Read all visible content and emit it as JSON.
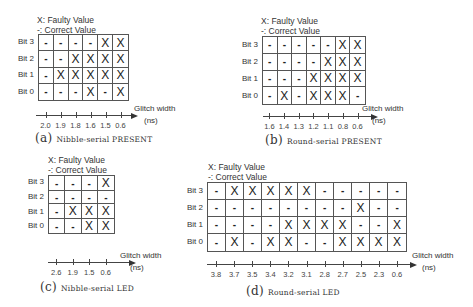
{
  "legend": {
    "faulty": "X: Faulty Value",
    "correct": "-: Correct Value"
  },
  "row_labels": [
    "Bit 3",
    "Bit 2",
    "Bit 1",
    "Bit 0"
  ],
  "axis": {
    "label_line1": "Glitch width",
    "label_line2": "(ns)"
  },
  "panels": [
    {
      "id": "a",
      "tag": "(a)",
      "caption": "Nibble-serial PRESENT",
      "glitch_widths": [
        "2.0",
        "1.9",
        "1.8",
        "1.6",
        "1.5",
        "0.6"
      ],
      "rows": [
        [
          "-",
          "-",
          "-",
          "-",
          "X",
          "X"
        ],
        [
          "-",
          "-",
          "X",
          "X",
          "X",
          "X"
        ],
        [
          "-",
          "X",
          "X",
          "X",
          "X",
          "X"
        ],
        [
          "-",
          "-",
          "-",
          "X",
          "-",
          "X"
        ]
      ]
    },
    {
      "id": "b",
      "tag": "(b)",
      "caption": "Round-serial PRESENT",
      "glitch_widths": [
        "1.6",
        "1.4",
        "1.3",
        "1.2",
        "1.1",
        "0.8",
        "0.6"
      ],
      "rows": [
        [
          "-",
          "-",
          "-",
          "-",
          "-",
          "X",
          "X"
        ],
        [
          "-",
          "-",
          "-",
          "-",
          "X",
          "X",
          "X"
        ],
        [
          "-",
          "-",
          "-",
          "X",
          "X",
          "X",
          "X"
        ],
        [
          "-",
          "X",
          "-",
          "X",
          "X",
          "X",
          "-"
        ]
      ]
    },
    {
      "id": "c",
      "tag": "(c)",
      "caption": "Nibble-serial LED",
      "glitch_widths": [
        "2.6",
        "1.9",
        "1.5",
        "0.6"
      ],
      "rows": [
        [
          "-",
          "-",
          "-",
          "X"
        ],
        [
          "-",
          "-",
          "-",
          "-"
        ],
        [
          "-",
          "X",
          "X",
          "X"
        ],
        [
          "-",
          "-",
          "X",
          "X"
        ]
      ]
    },
    {
      "id": "d",
      "tag": "(d)",
      "caption": "Round-serial LED",
      "glitch_widths": [
        "3.8",
        "3.7",
        "3.5",
        "3.4",
        "3.2",
        "3.1",
        "2.8",
        "2.7",
        "2.5",
        "2.3",
        "0.6"
      ],
      "rows": [
        [
          "-",
          "X",
          "X",
          "X",
          "X",
          "X",
          "-",
          "-",
          "-",
          "-",
          "-"
        ],
        [
          "-",
          "-",
          "-",
          "-",
          "-",
          "-",
          "-",
          "-",
          "X",
          "-",
          "-"
        ],
        [
          "-",
          "-",
          "-",
          "-",
          "X",
          "X",
          "X",
          "X",
          "-",
          "-",
          "X"
        ],
        [
          "-",
          "X",
          "-",
          "X",
          "X",
          "-",
          "-",
          "X",
          "X",
          "X",
          "X"
        ]
      ]
    }
  ],
  "layout": {
    "a": {
      "legend_x": 37,
      "legend_y": 15,
      "grid_x": 38,
      "grid_y": 34,
      "cell_w": 15,
      "cell_h": 16.5,
      "axis_y": 115,
      "axis_x0": 36,
      "axis_x1": 133,
      "tick_y": 126,
      "axislabel_x": 134,
      "axislabel_y": 104,
      "caption_x": 35,
      "caption_y": 131
    },
    "b": {
      "legend_x": 261,
      "legend_y": 16,
      "grid_x": 262,
      "grid_y": 36,
      "cell_w": 14.7,
      "cell_h": 17,
      "axis_y": 116,
      "axis_x0": 263,
      "axis_x1": 373,
      "tick_y": 124,
      "axislabel_x": 362,
      "axislabel_y": 104,
      "caption_x": 265,
      "caption_y": 133
    },
    "c": {
      "legend_x": 48,
      "legend_y": 155,
      "grid_x": 48,
      "grid_y": 175,
      "cell_w": 16.5,
      "cell_h": 14.6,
      "axis_y": 262,
      "axis_x0": 48,
      "axis_x1": 131,
      "tick_y": 266,
      "axislabel_x": 120,
      "axislabel_y": 251,
      "caption_x": 40,
      "caption_y": 280
    },
    "d": {
      "legend_x": 208,
      "legend_y": 162,
      "grid_x": 207,
      "grid_y": 182,
      "cell_w": 18.1,
      "cell_h": 17.2,
      "axis_y": 264,
      "axis_x0": 207,
      "axis_x1": 412,
      "tick_y": 268,
      "axislabel_x": 412,
      "axislabel_y": 251,
      "caption_x": 246,
      "caption_y": 284
    }
  },
  "colors": {
    "grid": "#555555",
    "text": "#222222",
    "background": "#ffffff"
  }
}
